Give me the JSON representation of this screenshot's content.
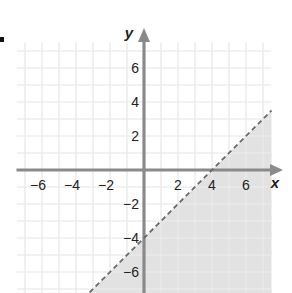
{
  "chart_data": {
    "type": "line",
    "title": "",
    "xlabel": "x",
    "ylabel": "y",
    "xlim": [
      -7.5,
      7.5
    ],
    "ylim": [
      -7.3,
      7.5
    ],
    "grid": true,
    "grid_step": 1,
    "x_ticks": [
      -6,
      -4,
      -2,
      2,
      4,
      6
    ],
    "y_ticks": [
      6,
      4,
      2,
      -2,
      -4,
      -6
    ],
    "x_tick_labels": [
      "−6",
      "−4",
      "−2",
      "2",
      "4",
      "6"
    ],
    "y_tick_labels": [
      "6",
      "4",
      "2",
      "−2",
      "−4",
      "−6"
    ],
    "series": [
      {
        "name": "boundary line y = x − 4",
        "style": "dashed",
        "points": [
          [
            -3.2,
            -7.2
          ],
          [
            0,
            -4
          ],
          [
            4,
            0
          ],
          [
            7.5,
            3.5
          ]
        ]
      }
    ],
    "shaded_region": {
      "description": "y < x − 4 (below/right of dashed line)",
      "inequality": "y < x - 4",
      "color": "#e2e2e2"
    },
    "colors": {
      "axis": "#8a8a8a",
      "grid": "#e6e6e6",
      "boundary": "#6a6a6a",
      "shade": "#e2e2e2",
      "text": "#222222"
    }
  },
  "labels": {
    "x_axis": "x",
    "y_axis": "y"
  }
}
